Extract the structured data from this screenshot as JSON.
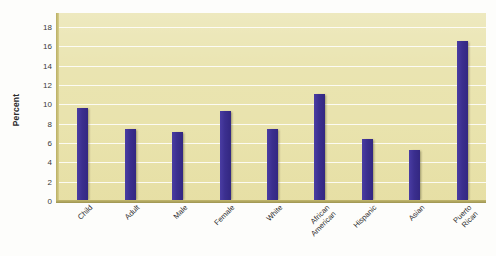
{
  "chart_data": {
    "type": "bar",
    "title": "",
    "subtitle": "",
    "xlabel": "",
    "ylabel": "Percent",
    "ylim": [
      0,
      18
    ],
    "ytick_step": 2,
    "yticks": [
      0,
      2,
      4,
      6,
      8,
      10,
      12,
      14,
      16,
      18
    ],
    "grid": true,
    "legend": false,
    "legend_position": "none",
    "categories": [
      "Child",
      "Adult",
      "Male",
      "Female",
      "White",
      "African American",
      "Hispanic",
      "Asian",
      "Puerto Rican"
    ],
    "category_lines": [
      [
        "Child"
      ],
      [
        "Adult"
      ],
      [
        "Male"
      ],
      [
        "Female"
      ],
      [
        "White"
      ],
      [
        "African",
        "American"
      ],
      [
        "Hispanic"
      ],
      [
        "Asian"
      ],
      [
        "Puerto",
        "Rican"
      ]
    ],
    "values": [
      9.6,
      7.5,
      7.1,
      9.3,
      7.5,
      11.1,
      6.4,
      5.3,
      16.6
    ],
    "bar_color": "#3b2f8f",
    "plot_background_color": "#e9e3ad",
    "gridline_color": "#ffffff",
    "axis_color": "#b9ae63",
    "figure_background_color": "#fdfdfb"
  }
}
